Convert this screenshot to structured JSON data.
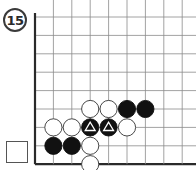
{
  "problem": {
    "number": "15"
  },
  "board": {
    "origin_x": 35,
    "origin_y": 17,
    "spacing": 18.4,
    "columns": 9,
    "rows": 9,
    "edges": [
      "left",
      "bottom"
    ],
    "colors": {
      "line": "#8a8a8a",
      "edge": "#2a2a2a",
      "black_stone": "#111111",
      "white_stone": "#ffffff",
      "white_stone_border": "#333333",
      "marker": "#ffffff"
    },
    "stones": [
      {
        "col": 3,
        "row": 5,
        "color": "white"
      },
      {
        "col": 4,
        "row": 5,
        "color": "white"
      },
      {
        "col": 5,
        "row": 5,
        "color": "black"
      },
      {
        "col": 6,
        "row": 5,
        "color": "black"
      },
      {
        "col": 1,
        "row": 6,
        "color": "white"
      },
      {
        "col": 2,
        "row": 6,
        "color": "white"
      },
      {
        "col": 3,
        "row": 6,
        "color": "black",
        "marker": "triangle"
      },
      {
        "col": 4,
        "row": 6,
        "color": "black",
        "marker": "triangle"
      },
      {
        "col": 5,
        "row": 6,
        "color": "white"
      },
      {
        "col": 1,
        "row": 7,
        "color": "black"
      },
      {
        "col": 2,
        "row": 7,
        "color": "black"
      },
      {
        "col": 3,
        "row": 7,
        "color": "white"
      },
      {
        "col": 3,
        "row": 8,
        "color": "white"
      }
    ]
  },
  "answer_box": {
    "label": ""
  }
}
